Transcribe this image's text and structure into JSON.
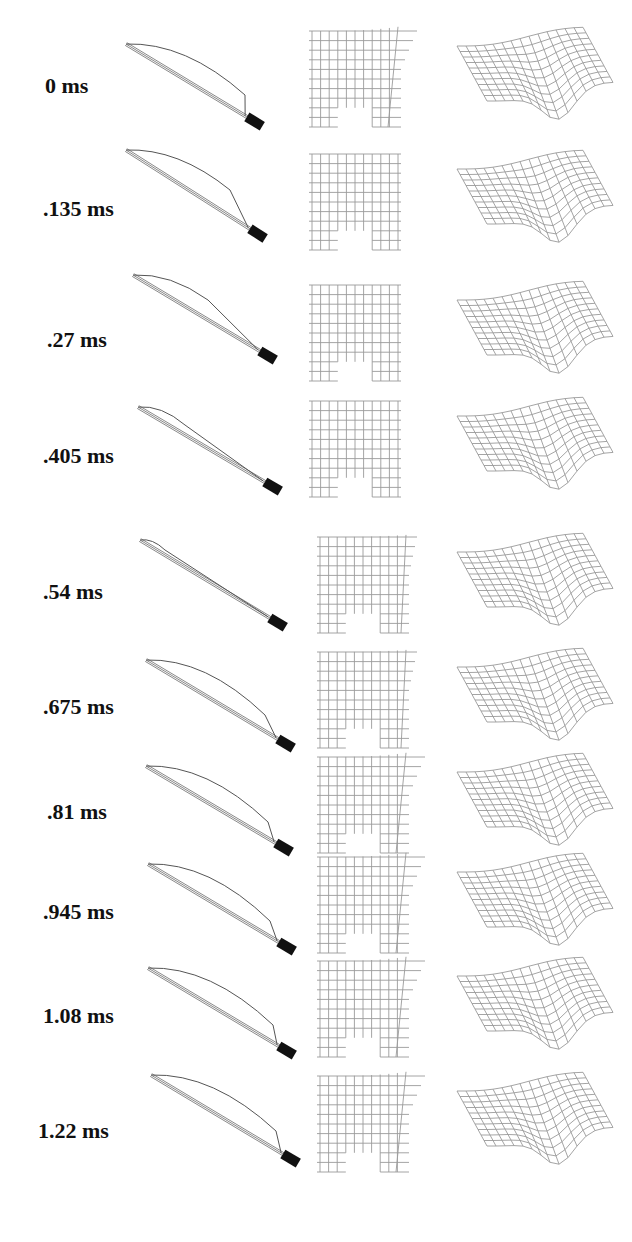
{
  "figure": {
    "columns": [
      "element-side-view",
      "planar-mesh",
      "surface-mesh"
    ],
    "frames": [
      {
        "time_label": "0 ms",
        "label_x": 45,
        "label_y": 86,
        "rod": {
          "x1": 126,
          "y1": 44,
          "x2": 252,
          "y2": 120
        },
        "wire_peak": {
          "x": 245,
          "y": 95
        },
        "mesh_shape": "curl-right"
      },
      {
        "time_label": ".135 ms",
        "label_x": 43,
        "label_y": 209,
        "rod": {
          "x1": 126,
          "y1": 150,
          "x2": 255,
          "y2": 232
        },
        "wire_peak": {
          "x": 230,
          "y": 190
        },
        "mesh_shape": "square"
      },
      {
        "time_label": ".27 ms",
        "label_x": 47,
        "label_y": 340,
        "rod": {
          "x1": 133,
          "y1": 275,
          "x2": 265,
          "y2": 354
        },
        "wire_peak": {
          "x": 208,
          "y": 300
        },
        "mesh_shape": "square"
      },
      {
        "time_label": ".405 ms",
        "label_x": 43,
        "label_y": 456,
        "rod": {
          "x1": 138,
          "y1": 407,
          "x2": 270,
          "y2": 485
        },
        "wire_peak": {
          "x": 185,
          "y": 425
        },
        "mesh_shape": "square"
      },
      {
        "time_label": ".54 ms",
        "label_x": 43,
        "label_y": 592,
        "rod": {
          "x1": 140,
          "y1": 540,
          "x2": 275,
          "y2": 621
        },
        "wire_peak": {
          "x": 165,
          "y": 550
        },
        "mesh_shape": "slight-curl"
      },
      {
        "time_label": ".675 ms",
        "label_x": 43,
        "label_y": 707,
        "rod": {
          "x1": 146,
          "y1": 660,
          "x2": 283,
          "y2": 742
        },
        "wire_peak": {
          "x": 265,
          "y": 715
        },
        "mesh_shape": "slight-curl"
      },
      {
        "time_label": ".81 ms",
        "label_x": 47,
        "label_y": 812,
        "rod": {
          "x1": 146,
          "y1": 766,
          "x2": 281,
          "y2": 846
        },
        "wire_peak": {
          "x": 268,
          "y": 822
        },
        "mesh_shape": "curl-right"
      },
      {
        "time_label": ".945 ms",
        "label_x": 43,
        "label_y": 912,
        "rod": {
          "x1": 148,
          "y1": 864,
          "x2": 284,
          "y2": 945
        },
        "wire_peak": {
          "x": 270,
          "y": 921
        },
        "mesh_shape": "curl-right"
      },
      {
        "time_label": "1.08 ms",
        "label_x": 43,
        "label_y": 1016,
        "rod": {
          "x1": 148,
          "y1": 968,
          "x2": 284,
          "y2": 1049
        },
        "wire_peak": {
          "x": 273,
          "y": 1025
        },
        "mesh_shape": "curl-right"
      },
      {
        "time_label": "1.22 ms",
        "label_x": 38,
        "label_y": 1131,
        "rod": {
          "x1": 151,
          "y1": 1075,
          "x2": 288,
          "y2": 1157
        },
        "wire_peak": {
          "x": 276,
          "y": 1131
        },
        "mesh_shape": "curl-right"
      }
    ]
  }
}
